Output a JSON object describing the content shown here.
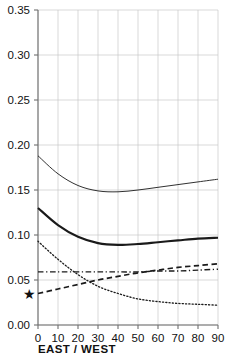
{
  "chart_data": {
    "type": "line",
    "title": "",
    "subtitle": "",
    "xlabel": "EAST / WEST",
    "ylabel": "",
    "xlim": [
      0,
      90
    ],
    "ylim": [
      0.0,
      0.35
    ],
    "grid": true,
    "legend": "none",
    "x_ticks": [
      0,
      10,
      20,
      30,
      40,
      50,
      60,
      70,
      80,
      90
    ],
    "x_tick_labels": [
      "0",
      "10",
      "20",
      "30",
      "40",
      "50",
      "60",
      "70",
      "80",
      "90"
    ],
    "y_ticks": [
      0.0,
      0.05,
      0.1,
      0.15,
      0.2,
      0.25,
      0.3,
      0.35
    ],
    "y_tick_labels": [
      "0.00",
      "0.05",
      "0.10",
      "0.15",
      "0.20",
      "0.25",
      "0.30",
      "0.35"
    ],
    "x": [
      0,
      10,
      20,
      30,
      40,
      50,
      60,
      70,
      80,
      90
    ],
    "series": [
      {
        "name": "thin-solid-upper",
        "style": "solid",
        "width": 0.9,
        "color": "#555555",
        "values": [
          0.188,
          0.168,
          0.155,
          0.149,
          0.148,
          0.15,
          0.153,
          0.156,
          0.159,
          0.162
        ]
      },
      {
        "name": "thick-solid-lower",
        "style": "solid",
        "width": 2.1,
        "color": "#1a1a1a",
        "values": [
          0.13,
          0.111,
          0.098,
          0.091,
          0.089,
          0.09,
          0.092,
          0.094,
          0.096,
          0.097
        ]
      },
      {
        "name": "long-dashed-rising",
        "style": "dashed",
        "width": 1.7,
        "color": "#1a1a1a",
        "values": [
          0.035,
          0.04,
          0.045,
          0.05,
          0.054,
          0.058,
          0.061,
          0.064,
          0.066,
          0.068
        ]
      },
      {
        "name": "dash-dot-flat",
        "style": "dash-dot",
        "width": 1.4,
        "color": "#1a1a1a",
        "values": [
          0.059,
          0.059,
          0.059,
          0.059,
          0.059,
          0.059,
          0.06,
          0.06,
          0.061,
          0.062
        ]
      },
      {
        "name": "dotted-falling",
        "style": "dotted",
        "width": 1.3,
        "color": "#555555",
        "values": [
          0.093,
          0.073,
          0.056,
          0.043,
          0.035,
          0.029,
          0.026,
          0.024,
          0.023,
          0.022
        ]
      }
    ],
    "annotations": [
      {
        "name": "star-marker",
        "symbol": "★",
        "x": -4.5,
        "y": 0.035,
        "note": "star plotted left of the y-axis at about 0.035"
      }
    ]
  }
}
